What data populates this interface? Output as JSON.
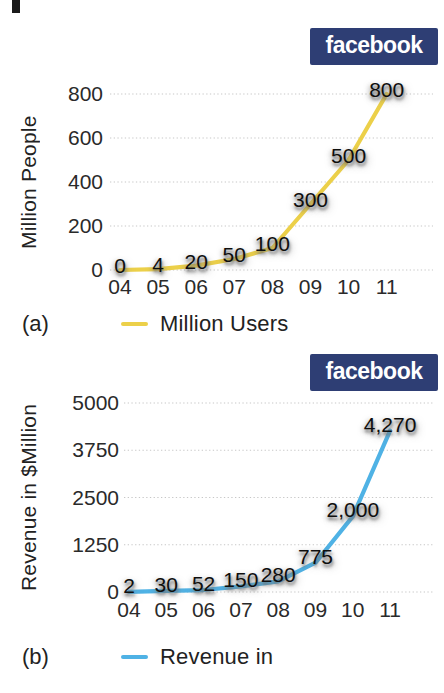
{
  "brand": {
    "logo_text": "facebook",
    "logo_bg": "#2e3e74",
    "logo_fg": "#ffffff"
  },
  "chart_data": [
    {
      "type": "line",
      "panel": "(a)",
      "title": "",
      "categories": [
        "04",
        "05",
        "06",
        "07",
        "08",
        "09",
        "10",
        "11"
      ],
      "values": [
        0,
        4,
        20,
        50,
        100,
        300,
        500,
        800
      ],
      "value_labels": [
        "0",
        "4",
        "20",
        "50",
        "100",
        "300",
        "500",
        "800"
      ],
      "xlabel": "",
      "ylabel": "Million People",
      "ylim": [
        0,
        800
      ],
      "yticks": [
        0,
        200,
        400,
        600,
        800
      ],
      "ytick_labels": [
        "0",
        "200",
        "400",
        "600",
        "800"
      ],
      "legend": [
        "Million Users"
      ],
      "legend_position": "bottom",
      "grid": "horizontal-dotted",
      "line_color": "#ecd049"
    },
    {
      "type": "line",
      "panel": "(b)",
      "title": "",
      "categories": [
        "04",
        "05",
        "06",
        "07",
        "08",
        "09",
        "10",
        "11"
      ],
      "values": [
        2,
        30,
        52,
        150,
        280,
        775,
        2000,
        4270
      ],
      "value_labels": [
        "2",
        "30",
        "52",
        "150",
        "280",
        "775",
        "2,000",
        "4,270"
      ],
      "xlabel": "",
      "ylabel": "Revenue in $Million",
      "ylim": [
        0,
        5000
      ],
      "yticks": [
        0,
        1250,
        2500,
        3750,
        5000
      ],
      "ytick_labels": [
        "0",
        "1250",
        "2500",
        "3750",
        "5000"
      ],
      "legend": [
        "Revenue in"
      ],
      "legend_position": "bottom",
      "grid": "horizontal-dotted",
      "line_color": "#4fb2e5"
    }
  ]
}
